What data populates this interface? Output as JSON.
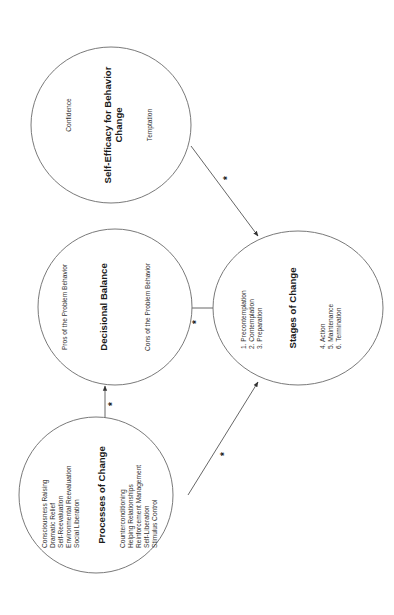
{
  "diagram": {
    "orientation": "rotated-90-ccw",
    "nodes": {
      "processes": {
        "title": "Processes of Change",
        "group_a": [
          "Consciousness Raising",
          "Dramatic Relief",
          "Self-Reevaluation",
          "Environmental Reevaluation",
          "Social Liberation"
        ],
        "group_b": [
          "Counterconditioning",
          "Helping Relationships",
          "Reinforcement Management",
          "Self-Liberation",
          "Stimulus Control"
        ]
      },
      "decisional": {
        "title": "Decisional Balance",
        "pros": "Pros of the Problem Behavior",
        "cons": "Cons of the Problem Behavior"
      },
      "efficacy": {
        "title_line1": "Self-Efficacy for Behavior",
        "title_line2": "Change",
        "confidence": "Confidence",
        "temptation": "Temptation"
      },
      "stages": {
        "title": "Stages of Change",
        "group_a": [
          "1. Precontemplation",
          "2. Contemplation",
          "3. Preparation"
        ],
        "group_b": [
          "4. Action",
          "5. Maintenance",
          "6. Termination"
        ]
      }
    },
    "edges": [
      {
        "from": "Processes of Change",
        "to": "Decisional Balance",
        "label": "*"
      },
      {
        "from": "Processes of Change",
        "to": "Stages of Change",
        "label": "*"
      },
      {
        "from": "Decisional Balance",
        "to": "Stages of Change",
        "label": "*"
      },
      {
        "from": "Self-Efficacy for Behavior Change",
        "to": "Stages of Change",
        "label": "*"
      }
    ],
    "colors": {
      "stroke": "#6a6a6a",
      "text": "#2a2a2a",
      "background": "#ffffff"
    }
  }
}
